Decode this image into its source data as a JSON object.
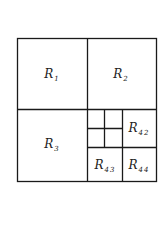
{
  "diagram": {
    "type": "quadtree-partition",
    "line_color": "#1a1a1a",
    "outer_box": {
      "x": 17,
      "y": 38,
      "width": 139,
      "height": 143
    },
    "lines": {
      "vertical": [
        {
          "x": 87,
          "y1": 38,
          "y2": 181
        },
        {
          "x": 122,
          "y1": 109,
          "y2": 181
        },
        {
          "x": 104,
          "y1": 109,
          "y2": 147
        }
      ],
      "horizontal": [
        {
          "y": 109,
          "x1": 17,
          "x2": 156
        },
        {
          "y": 147,
          "x1": 87,
          "x2": 156
        },
        {
          "y": 128,
          "x1": 87,
          "x2": 122
        }
      ]
    },
    "regions": [
      {
        "id": "R1",
        "base": "R",
        "sub": "1",
        "cx": 52,
        "cy": 75
      },
      {
        "id": "R2",
        "base": "R",
        "sub": "2",
        "cx": 121,
        "cy": 75
      },
      {
        "id": "R3",
        "base": "R",
        "sub": "3",
        "cx": 52,
        "cy": 145
      },
      {
        "id": "R42",
        "base": "R",
        "sub": "42",
        "cx": 139,
        "cy": 129
      },
      {
        "id": "R43",
        "base": "R",
        "sub": "43",
        "cx": 105,
        "cy": 166
      },
      {
        "id": "R44",
        "base": "R",
        "sub": "44",
        "cx": 139,
        "cy": 166
      }
    ]
  }
}
